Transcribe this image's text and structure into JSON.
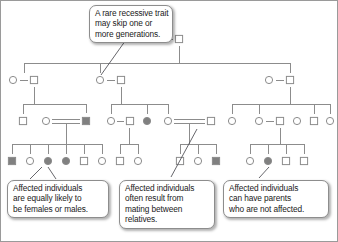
{
  "figure": {
    "line_color": "#8c8c8c",
    "affected_fill": "#808080",
    "unaffected_fill": "#ffffff",
    "symbol_stroke": "#8c8c8c",
    "callout_border": "#8d8d8d",
    "text_color": "#1a1a1a"
  },
  "callouts": {
    "top": {
      "name": "callout-recessive-skip",
      "lines": [
        "A rare recessive trait",
        "may skip one or",
        "more generations."
      ]
    },
    "bottom_left": {
      "name": "callout-equally-likely",
      "lines": [
        "Affected individuals",
        "are equally likely to",
        "be females or males."
      ]
    },
    "bottom_middle": {
      "name": "callout-consanguinity",
      "lines": [
        "Affected individuals",
        "often result from",
        "mating between",
        "relatives."
      ]
    },
    "bottom_right": {
      "name": "callout-unaffected-parents",
      "lines": [
        "Affected individuals",
        "can have parents",
        "who are not affected."
      ]
    }
  },
  "legend_semantics": {
    "circle": "female",
    "square": "male",
    "filled": "affected",
    "open": "unaffected",
    "double_line": "consanguineous mating"
  },
  "generations": [
    {
      "id": "I",
      "y": 38,
      "individuals": [
        {
          "name": "i-1",
          "shape": "circle",
          "sex": "female",
          "affected": false,
          "x": 157
        },
        {
          "name": "i-2",
          "shape": "square",
          "sex": "male",
          "affected": false,
          "x": 178
        }
      ]
    },
    {
      "id": "II",
      "y": 79,
      "individuals": [
        {
          "name": "ii-1",
          "shape": "circle",
          "sex": "female",
          "affected": false,
          "x": 12
        },
        {
          "name": "ii-2",
          "shape": "square",
          "sex": "male",
          "affected": false,
          "x": 33
        },
        {
          "name": "ii-3",
          "shape": "circle",
          "sex": "female",
          "affected": false,
          "x": 99
        },
        {
          "name": "ii-4",
          "shape": "square",
          "sex": "male",
          "affected": false,
          "x": 120
        },
        {
          "name": "ii-5",
          "shape": "circle",
          "sex": "female",
          "affected": false,
          "x": 268
        },
        {
          "name": "ii-6",
          "shape": "square",
          "sex": "male",
          "affected": false,
          "x": 289
        }
      ]
    },
    {
      "id": "III",
      "y": 120,
      "individuals": [
        {
          "name": "iii-1",
          "shape": "square",
          "sex": "male",
          "affected": false,
          "x": 22
        },
        {
          "name": "iii-2",
          "shape": "circle",
          "sex": "female",
          "affected": false,
          "x": 45
        },
        {
          "name": "iii-3",
          "shape": "square",
          "sex": "male",
          "affected": true,
          "x": 85
        },
        {
          "name": "iii-4",
          "shape": "circle",
          "sex": "female",
          "affected": false,
          "x": 110
        },
        {
          "name": "iii-5",
          "shape": "square",
          "sex": "male",
          "affected": false,
          "x": 129
        },
        {
          "name": "iii-6",
          "shape": "circle",
          "sex": "female",
          "affected": true,
          "x": 146
        },
        {
          "name": "iii-7",
          "shape": "circle",
          "sex": "female",
          "affected": false,
          "x": 167
        },
        {
          "name": "iii-8",
          "shape": "square",
          "sex": "male",
          "affected": false,
          "x": 210
        },
        {
          "name": "iii-9",
          "shape": "circle",
          "sex": "female",
          "affected": false,
          "x": 231
        },
        {
          "name": "iii-10",
          "shape": "circle",
          "sex": "female",
          "affected": false,
          "x": 258
        },
        {
          "name": "iii-11",
          "shape": "square",
          "sex": "male",
          "affected": false,
          "x": 279
        },
        {
          "name": "iii-12",
          "shape": "circle",
          "sex": "female",
          "affected": false,
          "x": 296
        },
        {
          "name": "iii-13",
          "shape": "square",
          "sex": "male",
          "affected": false,
          "x": 313
        },
        {
          "name": "iii-14",
          "shape": "circle",
          "sex": "female",
          "affected": false,
          "x": 329
        }
      ]
    },
    {
      "id": "IV",
      "y": 160,
      "individuals": [
        {
          "name": "iv-1",
          "shape": "square",
          "sex": "male",
          "affected": true,
          "x": 11
        },
        {
          "name": "iv-2",
          "shape": "circle",
          "sex": "female",
          "affected": false,
          "x": 29
        },
        {
          "name": "iv-3",
          "shape": "circle",
          "sex": "female",
          "affected": true,
          "x": 47
        },
        {
          "name": "iv-4",
          "shape": "circle",
          "sex": "female",
          "affected": true,
          "x": 65
        },
        {
          "name": "iv-5",
          "shape": "square",
          "sex": "male",
          "affected": false,
          "x": 83
        },
        {
          "name": "iv-6",
          "shape": "circle",
          "sex": "female",
          "affected": false,
          "x": 101
        },
        {
          "name": "iv-7",
          "shape": "square",
          "sex": "male",
          "affected": false,
          "x": 119
        },
        {
          "name": "iv-8",
          "shape": "circle",
          "sex": "female",
          "affected": false,
          "x": 137
        },
        {
          "name": "iv-9",
          "shape": "square",
          "sex": "male",
          "affected": false,
          "x": 179
        },
        {
          "name": "iv-10",
          "shape": "circle",
          "sex": "female",
          "affected": false,
          "x": 197
        },
        {
          "name": "iv-11",
          "shape": "square",
          "sex": "male",
          "affected": true,
          "x": 215
        },
        {
          "name": "iv-12",
          "shape": "circle",
          "sex": "female",
          "affected": false,
          "x": 249
        },
        {
          "name": "iv-13",
          "shape": "circle",
          "sex": "female",
          "affected": true,
          "x": 267
        },
        {
          "name": "iv-14",
          "shape": "square",
          "sex": "male",
          "affected": false,
          "x": 285
        },
        {
          "name": "iv-15",
          "shape": "square",
          "sex": "male",
          "affected": false,
          "x": 303
        }
      ]
    }
  ]
}
